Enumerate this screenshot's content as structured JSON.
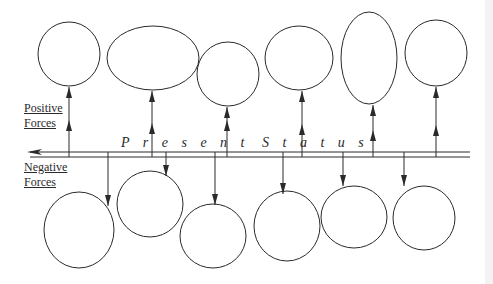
{
  "labels": {
    "positive_line1": "Positive",
    "positive_line2": "Forces",
    "negative_line1": "Negative",
    "negative_line2": "Forces",
    "status_word1": "P r e s e n t",
    "status_word2": "S t a t u s"
  },
  "colors": {
    "stroke": "#2a2a2a",
    "background": "#ffffff"
  },
  "diagram": {
    "type": "force-field analysis",
    "center_line": "Present Status",
    "positive_forces_count": 6,
    "negative_forces_count": 6
  }
}
